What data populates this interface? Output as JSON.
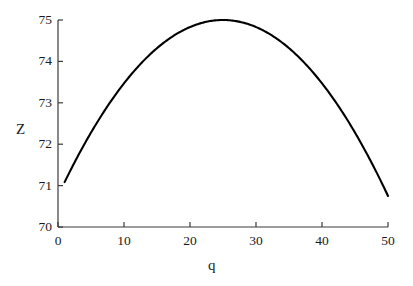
{
  "chart_data": {
    "type": "line",
    "title": "",
    "xlabel": "q",
    "ylabel": "Z",
    "xlim": [
      0,
      50
    ],
    "ylim": [
      70,
      75
    ],
    "xticks": [
      0,
      10,
      20,
      30,
      40,
      50
    ],
    "yticks": [
      70,
      71,
      72,
      73,
      74,
      75
    ],
    "xtick_labels": [
      "0",
      "10",
      "20",
      "30",
      "40",
      "50"
    ],
    "ytick_labels": [
      "70",
      "71",
      "72",
      "73",
      "74",
      "75"
    ],
    "grid": false,
    "legend": null,
    "series": [
      {
        "name": "Z(q)",
        "color": "#000000",
        "x": [
          1,
          2.5,
          5,
          7.5,
          10,
          12.5,
          15,
          17.5,
          20,
          22.5,
          25,
          27.5,
          30,
          32.5,
          35,
          37.5,
          40,
          42.5,
          45,
          47.5,
          50
        ],
        "values": [
          71.08,
          71.38,
          71.78,
          72.12,
          72.47,
          72.75,
          73.0,
          73.22,
          73.4,
          73.55,
          75.0,
          74.96,
          74.83,
          74.61,
          74.32,
          73.94,
          73.47,
          72.92,
          72.28,
          71.56,
          70.75
        ]
      }
    ],
    "curve_model": {
      "form": "Z = peak - a*(q - vertex)^2",
      "peak": 75.0,
      "vertex_q": 25,
      "a": 0.0068,
      "q_start": 1,
      "q_end": 50,
      "z_at_q_start": 71.08,
      "z_at_q_end": 70.75
    }
  },
  "axes": {
    "x_title": "q",
    "y_title": "Z"
  },
  "colors": {
    "curve": "#000000",
    "axis": "#3a3a3a",
    "text": "#1a1a1a",
    "background": "#ffffff"
  }
}
